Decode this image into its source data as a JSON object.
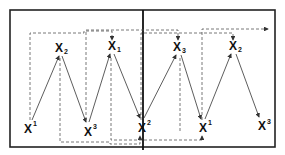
{
  "diagram": {
    "nodes": [
      {
        "id": "n1",
        "base": "X",
        "index": "1",
        "position": "superscript",
        "level": "bottom"
      },
      {
        "id": "n2",
        "base": "X",
        "index": "2",
        "position": "subscript",
        "level": "top"
      },
      {
        "id": "n3",
        "base": "X",
        "index": "3",
        "position": "superscript",
        "level": "bottom"
      },
      {
        "id": "n4",
        "base": "X",
        "index": "1",
        "position": "subscript",
        "level": "top"
      },
      {
        "id": "n5",
        "base": "X",
        "index": "2",
        "position": "superscript",
        "level": "bottom"
      },
      {
        "id": "n6",
        "base": "X",
        "index": "3",
        "position": "subscript",
        "level": "top"
      },
      {
        "id": "n7",
        "base": "X",
        "index": "1",
        "position": "superscript",
        "level": "bottom"
      },
      {
        "id": "n8",
        "base": "X",
        "index": "2",
        "position": "subscript",
        "level": "top"
      },
      {
        "id": "n9",
        "base": "X",
        "index": "3",
        "position": "superscript",
        "level": "bottom"
      }
    ],
    "solid_edges": [
      [
        "n1",
        "n2"
      ],
      [
        "n2",
        "n3"
      ],
      [
        "n3",
        "n4"
      ],
      [
        "n4",
        "n5"
      ],
      [
        "n5",
        "n6"
      ],
      [
        "n6",
        "n7"
      ],
      [
        "n7",
        "n8"
      ],
      [
        "n8",
        "n9"
      ]
    ],
    "dashed_edges": [
      [
        "n1",
        "n4"
      ],
      [
        "n2",
        "n5"
      ],
      [
        "n3",
        "n6"
      ],
      [
        "n4",
        "n7"
      ],
      [
        "n5",
        "n8"
      ],
      [
        "n6",
        "continue-right"
      ]
    ],
    "panels": 2
  }
}
